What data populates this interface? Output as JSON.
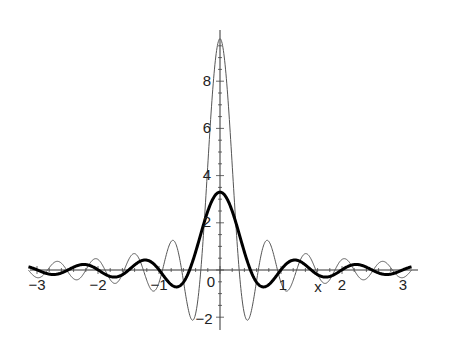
{
  "chart_data": {
    "type": "line",
    "title": "",
    "xlabel": "x",
    "ylabel": "",
    "xlim": [
      -3.14,
      3.14
    ],
    "ylim": [
      -2.3,
      10
    ],
    "grid": false,
    "legend": null,
    "x_ticks": [
      -3,
      -2,
      -1,
      1,
      2,
      3
    ],
    "x_tick_labels": [
      "-3",
      "-2",
      "-1",
      "1",
      "2",
      "3"
    ],
    "y_ticks": [
      8,
      6,
      4,
      2,
      -2
    ],
    "y_tick_labels": [
      "8",
      "6",
      "4",
      "2",
      "-2"
    ],
    "origin_label": "0",
    "series": [
      {
        "name": "thin",
        "style": "thin gray line",
        "color": "#555555",
        "description": "narrow oscillating kernel, peak about 9.8 at x=0, minimum about -2.2 near x=±0.45",
        "peak": 9.8,
        "freq": 10
      },
      {
        "name": "bold",
        "style": "thick black line",
        "color": "#000000",
        "description": "broad kernel, peak about 3.3 at x=0, first minima about -0.9 near x=±0.7",
        "peak": 3.3,
        "freq": 6.3
      }
    ]
  },
  "labels": {
    "x_axis_name": "x",
    "origin": "0",
    "xticks": [
      "-3",
      "-2",
      "-1",
      "1",
      "2",
      "3"
    ],
    "yticks": [
      "8",
      "6",
      "4",
      "2",
      "-2"
    ]
  }
}
